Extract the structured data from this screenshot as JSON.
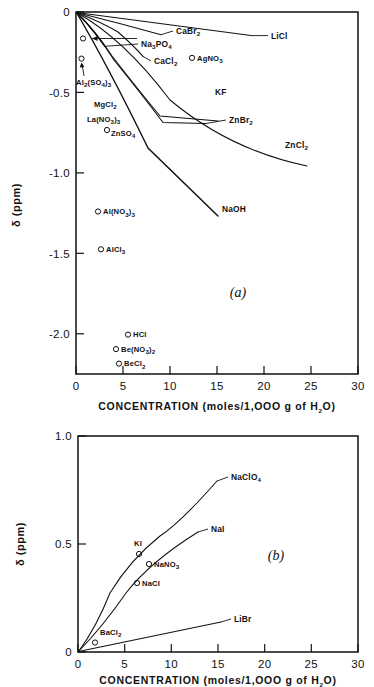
{
  "figure": {
    "title": "",
    "panels": [
      "a",
      "b"
    ]
  },
  "chart_data": [
    {
      "id": "panel-a",
      "type": "line",
      "panel_label": "(a)",
      "title": "",
      "xlabel": "CONCENTRATION (moles/1,000 g of H2O)",
      "xlabel_parts": {
        "main": "CONCENTRATION",
        "paren_open": "(moles/1,OOO g of H",
        "sub": "2",
        "paren_close": "O)"
      },
      "ylabel": "δ (ppm)",
      "xlim": [
        0,
        30
      ],
      "ylim": [
        -2.25,
        0
      ],
      "xticks": [
        0,
        5,
        10,
        15,
        20,
        25,
        30
      ],
      "xtick_labels": [
        "0",
        "5",
        "10",
        "15",
        "20",
        "25",
        "30"
      ],
      "yticks": [
        0,
        -0.5,
        -1.0,
        -1.5,
        -2.0
      ],
      "ytick_labels": [
        "0",
        "-0.5",
        "-1.0",
        "-1.5",
        "-2.0"
      ],
      "grid": false,
      "legend": "inline-labels",
      "series": [
        {
          "name": "LiCl",
          "label": "LiCl",
          "label_x": 20.2,
          "label_y": -0.125,
          "points": [
            [
              0,
              0
            ],
            [
              5,
              -0.038
            ],
            [
              10,
              -0.078
            ],
            [
              15,
              -0.118
            ],
            [
              18.6,
              -0.147
            ]
          ]
        },
        {
          "name": "CaBr2",
          "label": "CaBr2",
          "label_sub": "2",
          "label_x": 10.4,
          "label_y": -0.148,
          "points": [
            [
              0,
              0
            ],
            [
              3,
              -0.047
            ],
            [
              6,
              -0.094
            ],
            [
              9,
              -0.141
            ]
          ]
        },
        {
          "name": "Na3PO4",
          "label": "Na3PO4",
          "label_sub1": "3",
          "label_sub2": "4",
          "label_x": 9.6,
          "label_y": -0.245,
          "points": [
            [
              0,
              0
            ],
            [
              1.1,
              -0.078
            ],
            [
              2.2,
              -0.157
            ],
            [
              3.0,
              -0.213
            ]
          ]
        },
        {
          "name": "CaCl2",
          "label": "CaCl2",
          "label_sub": "2",
          "label_x": 10.2,
          "label_y": -0.345,
          "points": [
            [
              0,
              0
            ],
            [
              2.6,
              -0.085
            ],
            [
              5.2,
              -0.185
            ],
            [
              7.1,
              -0.276
            ]
          ]
        },
        {
          "name": "KF",
          "label": "KF",
          "label_x": 14.8,
          "label_y": -0.565,
          "points": [
            [
              0,
              0
            ],
            [
              2,
              -0.105
            ],
            [
              5,
              -0.275
            ],
            [
              9,
              -0.47
            ],
            [
              13.2,
              -0.63
            ],
            [
              15.1,
              -0.678
            ]
          ]
        },
        {
          "name": "ZnBr2",
          "label": "ZnBr2",
          "label_sub": "2",
          "label_x": 17.2,
          "label_y": -0.685,
          "points": [
            [
              0,
              0
            ],
            [
              2,
              -0.115
            ],
            [
              5,
              -0.3
            ],
            [
              9,
              -0.5
            ],
            [
              13.5,
              -0.655
            ],
            [
              15.0,
              -0.69
            ]
          ]
        },
        {
          "name": "ZnCl2",
          "label": "ZnCl2",
          "label_sub": "2",
          "label_x": 22.2,
          "label_y": -0.805,
          "points": [
            [
              0,
              0
            ],
            [
              5,
              -0.175
            ],
            [
              10,
              -0.36
            ],
            [
              15,
              -0.55
            ],
            [
              20,
              -0.755
            ],
            [
              24.6,
              -0.955
            ]
          ]
        },
        {
          "name": "NaOH",
          "label": "NaOH",
          "label_x": 16.6,
          "label_y": -1.215,
          "points": [
            [
              0,
              0
            ],
            [
              3,
              -0.21
            ],
            [
              6,
              -0.45
            ],
            [
              9,
              -0.72
            ],
            [
              12,
              -1.0
            ],
            [
              15.1,
              -1.265
            ]
          ]
        }
      ],
      "scatter": [
        {
          "name": "AgNO3",
          "label": "AgNO3",
          "label_sub": "3",
          "x": 12.3,
          "y": -0.285,
          "label_side": "right"
        },
        {
          "name": "Al2(SO4)3",
          "label": "Al2(SO4)3",
          "x": 0.6,
          "y": -0.29,
          "label_side": "arrow-below",
          "label_x": 0.45,
          "label_y": -0.475
        },
        {
          "name": "unlabeled-near-origin",
          "label": "",
          "x": 0.75,
          "y": -0.165,
          "label_side": "none"
        },
        {
          "name": "MgCl2",
          "label": "MgCl2",
          "label_sub": "2",
          "x": 2.9,
          "y": -0.585,
          "label_side": "left-text-only",
          "label_x": 1.9,
          "label_y": -0.585
        },
        {
          "name": "La(NO3)3",
          "label": "La(NO3)3",
          "x": 2.6,
          "y": -0.672,
          "label_side": "left-text-only",
          "label_x": 1.45,
          "label_y": -0.672
        },
        {
          "name": "ZnSO4",
          "label": "ZnSO4",
          "label_sub": "4",
          "x": 3.3,
          "y": -0.745,
          "label_side": "right"
        },
        {
          "name": "Al(NO3)3",
          "label": "Al(NO3)3",
          "x": 3.1,
          "y": -1.24,
          "label_side": "right"
        },
        {
          "name": "AlCl3",
          "label": "AlCl3",
          "label_sub": "3",
          "x": 3.4,
          "y": -1.475,
          "label_side": "right"
        },
        {
          "name": "HCl",
          "label": "HCl",
          "x": 5.5,
          "y": -2.005,
          "label_side": "right"
        },
        {
          "name": "Be(NO3)2",
          "label": "Be(NO3)2",
          "x": 4.3,
          "y": -2.095,
          "label_side": "right"
        },
        {
          "name": "BeCl2",
          "label": "BeCl2",
          "label_sub": "2",
          "x": 4.6,
          "y": -2.185,
          "label_side": "right"
        }
      ]
    },
    {
      "id": "panel-b",
      "type": "line",
      "panel_label": "(b)",
      "title": "",
      "xlabel": "CONCENTRATION (moles/1,000 g of H2O)",
      "xlabel_parts": {
        "main": "CONCENTRATION",
        "paren_open": "(moles/1,OOO g of H",
        "sub": "2",
        "paren_close": "O)"
      },
      "ylabel": "δ (ppm)",
      "xlim": [
        0,
        30
      ],
      "ylim": [
        0,
        1.0
      ],
      "xticks": [
        0,
        5,
        10,
        15,
        20,
        25,
        30
      ],
      "xtick_labels": [
        "0",
        "5",
        "10",
        "15",
        "20",
        "25",
        "30"
      ],
      "yticks": [
        0,
        0.5,
        1.0
      ],
      "ytick_labels": [
        "0",
        "0.5",
        "1.0"
      ],
      "grid": false,
      "legend": "inline-labels",
      "series": [
        {
          "name": "NaClO4",
          "label": "NaClO4",
          "label_sub": "4",
          "label_x": 16.2,
          "label_y": 0.805,
          "points": [
            [
              0,
              0
            ],
            [
              1,
              0.115
            ],
            [
              2.5,
              0.27
            ],
            [
              5,
              0.455
            ],
            [
              7.5,
              0.575
            ],
            [
              10,
              0.665
            ],
            [
              12.5,
              0.735
            ],
            [
              14.9,
              0.79
            ]
          ]
        },
        {
          "name": "NaI",
          "label": "NaI",
          "label_x": 14.0,
          "label_y": 0.585,
          "points": [
            [
              0,
              0
            ],
            [
              2,
              0.105
            ],
            [
              4,
              0.205
            ],
            [
              6,
              0.3
            ],
            [
              8,
              0.385
            ],
            [
              10,
              0.46
            ],
            [
              12,
              0.525
            ],
            [
              12.9,
              0.553
            ]
          ]
        },
        {
          "name": "LiBr",
          "label": "LiBr",
          "label_x": 16.3,
          "label_y": 0.152,
          "points": [
            [
              0,
              0
            ],
            [
              5,
              0.045
            ],
            [
              10,
              0.092
            ],
            [
              15.3,
              0.138
            ]
          ]
        }
      ],
      "scatter": [
        {
          "name": "KI",
          "label": "KI",
          "x": 6.5,
          "y": 0.45,
          "label_side": "above",
          "label_x": 6.3,
          "label_y": 0.515
        },
        {
          "name": "NaNO3",
          "label": "NaNO3",
          "label_sub": "3",
          "x": 7.6,
          "y": 0.405,
          "label_side": "right"
        },
        {
          "name": "NaCl",
          "label": "NaCl",
          "x": 6.3,
          "y": 0.317,
          "label_side": "right"
        },
        {
          "name": "BaCl2",
          "label": "BaCl2",
          "label_sub": "2",
          "x": 1.8,
          "y": 0.042,
          "label_side": "above",
          "label_x": 2.2,
          "label_y": 0.098
        }
      ]
    }
  ]
}
